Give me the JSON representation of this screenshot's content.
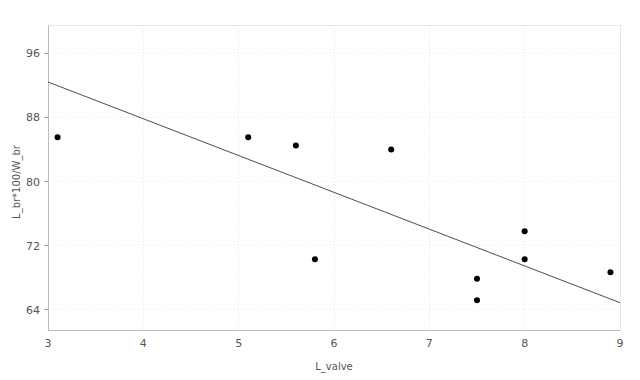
{
  "chart_data": {
    "type": "scatter",
    "title": "",
    "xlabel": "L_valve",
    "ylabel": "L_br*100/W_br",
    "xlim": [
      3,
      9
    ],
    "ylim": [
      61.5,
      99.5
    ],
    "xticks": [
      3,
      4,
      5,
      6,
      7,
      8,
      9
    ],
    "yticks": [
      64,
      72,
      80,
      88,
      96
    ],
    "xtick_labels": [
      "3",
      "4",
      "5",
      "6",
      "7",
      "8",
      "9"
    ],
    "ytick_labels": [
      "64",
      "72",
      "80",
      "88",
      "96"
    ],
    "grid": true,
    "legend": "none",
    "x": [
      3.1,
      5.1,
      5.6,
      5.8,
      6.6,
      7.5,
      7.5,
      8.0,
      8.0,
      8.9
    ],
    "y": [
      85.5,
      85.5,
      84.5,
      70.3,
      84.0,
      67.9,
      65.2,
      73.8,
      70.3,
      68.7
    ],
    "points": [
      {
        "x": 3.1,
        "y": 85.5
      },
      {
        "x": 5.1,
        "y": 85.5
      },
      {
        "x": 5.6,
        "y": 84.5
      },
      {
        "x": 5.8,
        "y": 70.3
      },
      {
        "x": 6.6,
        "y": 84.0
      },
      {
        "x": 7.5,
        "y": 67.9
      },
      {
        "x": 7.5,
        "y": 65.2
      },
      {
        "x": 8.0,
        "y": 73.8
      },
      {
        "x": 8.0,
        "y": 70.3
      },
      {
        "x": 8.9,
        "y": 68.7
      }
    ],
    "series": [
      {
        "name": "observations",
        "type": "scatter",
        "marker": "circle",
        "color": "#000000",
        "values": [
          85.5,
          85.5,
          84.5,
          70.3,
          84.0,
          67.9,
          65.2,
          73.8,
          70.3,
          68.7
        ]
      },
      {
        "name": "fit-line",
        "type": "line",
        "color": "#4d4d4d",
        "endpoints": [
          {
            "x": 3.0,
            "y": 92.4
          },
          {
            "x": 9.0,
            "y": 64.9
          }
        ]
      }
    ],
    "fit_line": {
      "x_start": 3.0,
      "y_start": 92.4,
      "x_end": 9.0,
      "y_end": 64.9,
      "slope": -4.58,
      "intercept": 106.15
    },
    "marker_size": 3,
    "point_color": "#000000",
    "line_color": "#4d4d4d",
    "grid_color": "#d9d9d9",
    "background_color": "#ffffff"
  },
  "footer": {
    "ghost_text": ""
  }
}
